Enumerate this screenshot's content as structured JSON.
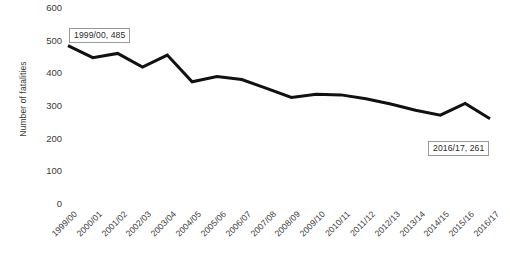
{
  "chart_data": {
    "type": "line",
    "title": "",
    "subtitle": "",
    "xlabel": "",
    "ylabel": "Number of fatalities",
    "ylim": [
      0,
      600
    ],
    "yticks": [
      0,
      100,
      200,
      300,
      400,
      500,
      600
    ],
    "ytick_labels": [
      "0",
      "100",
      "200",
      "300",
      "400",
      "500",
      "600"
    ],
    "grid": false,
    "legend": null,
    "legend_position": "none",
    "line_color": "#111111",
    "line_width": 3,
    "markers": false,
    "categories": [
      "1999/00",
      "2000/01",
      "2001/02",
      "2002/03",
      "2003/04",
      "2004/05",
      "2005/06",
      "2006/07",
      "2007/08",
      "2008/09",
      "2009/10",
      "2010/11",
      "2011/12",
      "2012/13",
      "2013/14",
      "2014/15",
      "2015/16",
      "2016/17"
    ],
    "values": [
      485,
      448,
      461,
      419,
      456,
      374,
      390,
      381,
      354,
      326,
      336,
      334,
      322,
      306,
      287,
      272,
      308,
      261
    ],
    "annotations": [
      {
        "name": "first-point-label",
        "text": "1999/00, 485",
        "category": "1999/00",
        "value": 485,
        "x_px": 69,
        "y_px": 28
      },
      {
        "name": "last-point-label",
        "text": "2016/17, 261",
        "category": "2016/17",
        "value": 261,
        "x_px": 428,
        "y_px": 141
      }
    ]
  }
}
